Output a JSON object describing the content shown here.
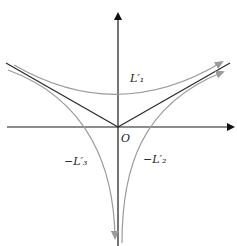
{
  "diagram": {
    "origin_label": "O",
    "labels": {
      "top": "L′₁",
      "left": "−L′₃",
      "right": "−L′₂"
    },
    "colors": {
      "axes": "#1a1a1a",
      "v_lines": "#2a2a2a",
      "curves": "#9a9a9a"
    }
  }
}
